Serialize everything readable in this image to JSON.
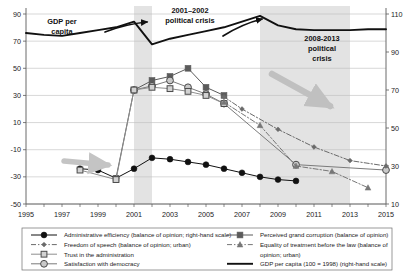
{
  "chart_data": {
    "type": "line",
    "title": "",
    "xlabel": "",
    "ylabel": "",
    "x": [
      1995,
      1996,
      1997,
      1998,
      1999,
      2000,
      2001,
      2002,
      2003,
      2004,
      2005,
      2006,
      2007,
      2008,
      2009,
      2010,
      2011,
      2012,
      2013,
      2014,
      2015
    ],
    "xlim": [
      1995,
      2015
    ],
    "xticks": [
      "1995",
      "1997",
      "1999",
      "2001",
      "2003",
      "2005",
      "2007",
      "2009",
      "2011",
      "2013",
      "2015"
    ],
    "left_axis": {
      "label": "balance of opinion",
      "ylim": [
        -50,
        90
      ],
      "yticks": [
        "90",
        "70",
        "50",
        "30",
        "10",
        "-10",
        "-30",
        "-50"
      ]
    },
    "right_axis": {
      "label": "GDP per capita (100 = 1998)",
      "ylim": [
        10,
        110
      ],
      "yticks": [
        "110",
        "90",
        "70",
        "50",
        "30",
        "10"
      ]
    },
    "grid": true,
    "legend_position": "bottom",
    "series": [
      {
        "name": "Administrative efficiency (balance of opinion; right-hand scale)",
        "key": "administrative-efficiency",
        "axis": "left",
        "marker": "filled-circle",
        "line": "solid",
        "color": "#111111",
        "points": [
          {
            "x": 1998,
            "y": -24
          },
          {
            "x": 1999,
            "y": -25
          },
          {
            "x": 2000,
            "y": -31
          },
          {
            "x": 2001,
            "y": -24
          },
          {
            "x": 2002,
            "y": -16
          },
          {
            "x": 2003,
            "y": -17
          },
          {
            "x": 2004,
            "y": -19
          },
          {
            "x": 2005,
            "y": -21
          },
          {
            "x": 2006,
            "y": -24
          },
          {
            "x": 2007,
            "y": -27
          },
          {
            "x": 2008,
            "y": -30
          },
          {
            "x": 2009,
            "y": -32
          },
          {
            "x": 2010,
            "y": -33
          }
        ]
      },
      {
        "name": "Perceived grand corruption (balance of opinion)",
        "key": "perceived-grand-corruption",
        "axis": "left",
        "marker": "filled-square",
        "line": "solid",
        "color": "#5b5b5b",
        "points": [
          {
            "x": 2000,
            "y": -31
          },
          {
            "x": 2001,
            "y": 34
          },
          {
            "x": 2002,
            "y": 41
          },
          {
            "x": 2003,
            "y": 44
          },
          {
            "x": 2004,
            "y": 50
          },
          {
            "x": 2005,
            "y": 36
          },
          {
            "x": 2006,
            "y": 30
          }
        ]
      },
      {
        "name": "Satisfaction with democracy",
        "key": "satisfaction-with-democracy",
        "axis": "left",
        "marker": "open-circle",
        "line": "solid",
        "color": "#7b7b7b",
        "points": [
          {
            "x": 2001,
            "y": 34
          },
          {
            "x": 2002,
            "y": 37
          },
          {
            "x": 2003,
            "y": 41
          },
          {
            "x": 2004,
            "y": 36
          },
          {
            "x": 2005,
            "y": 31
          },
          {
            "x": 2006,
            "y": 24
          },
          {
            "x": 2010,
            "y": -21
          },
          {
            "x": 2015,
            "y": -25
          }
        ]
      },
      {
        "name": "Trust in the administration",
        "key": "trust-in-the-administration",
        "axis": "left",
        "marker": "open-square",
        "line": "solid",
        "color": "#8e8e8e",
        "points": [
          {
            "x": 1998,
            "y": -25
          },
          {
            "x": 2000,
            "y": -32
          },
          {
            "x": 2001,
            "y": 34
          },
          {
            "x": 2002,
            "y": 36
          },
          {
            "x": 2003,
            "y": 35
          },
          {
            "x": 2004,
            "y": 33
          },
          {
            "x": 2005,
            "y": 30
          },
          {
            "x": 2006,
            "y": 24
          }
        ]
      },
      {
        "name": "Freedom of speech (balance of opinion; urban)",
        "key": "freedom-of-speech",
        "axis": "left",
        "marker": "small-diamond",
        "line": "dash-dot",
        "color": "#6a6a6a",
        "points": [
          {
            "x": 2006,
            "y": 29
          },
          {
            "x": 2007,
            "y": 20
          },
          {
            "x": 2009,
            "y": 5
          },
          {
            "x": 2011,
            "y": -8
          },
          {
            "x": 2013,
            "y": -18
          },
          {
            "x": 2015,
            "y": -22
          }
        ]
      },
      {
        "name": "Equality of treatment before the law (balance of opinion; urban)",
        "key": "equality-of-treatment",
        "axis": "left",
        "marker": "triangle",
        "line": "dash-dot",
        "color": "#777777",
        "points": [
          {
            "x": 2006,
            "y": 25
          },
          {
            "x": 2008,
            "y": 8
          },
          {
            "x": 2010,
            "y": -22
          },
          {
            "x": 2012,
            "y": -26
          },
          {
            "x": 2014,
            "y": -38
          }
        ]
      },
      {
        "name": "GDP per capita (100 = 1998) (right-hand scale)",
        "key": "gdp-per-capita",
        "axis": "right",
        "marker": "none",
        "line": "thick-solid",
        "color": "#111111",
        "points": [
          {
            "x": 1995,
            "y": 100
          },
          {
            "x": 1996,
            "y": 99
          },
          {
            "x": 1997,
            "y": 98.5
          },
          {
            "x": 1998,
            "y": 100
          },
          {
            "x": 1999,
            "y": 101.5
          },
          {
            "x": 2000,
            "y": 103
          },
          {
            "x": 2001,
            "y": 106
          },
          {
            "x": 2002,
            "y": 94
          },
          {
            "x": 2003,
            "y": 97
          },
          {
            "x": 2004,
            "y": 99
          },
          {
            "x": 2005,
            "y": 101
          },
          {
            "x": 2006,
            "y": 103
          },
          {
            "x": 2007,
            "y": 106
          },
          {
            "x": 2008,
            "y": 109
          },
          {
            "x": 2009,
            "y": 104
          },
          {
            "x": 2010,
            "y": 102
          },
          {
            "x": 2011,
            "y": 101.5
          },
          {
            "x": 2012,
            "y": 101.5
          },
          {
            "x": 2013,
            "y": 101.5
          },
          {
            "x": 2014,
            "y": 102
          },
          {
            "x": 2015,
            "y": 102
          }
        ]
      }
    ],
    "annotations": [
      {
        "key": "gdp-per-capita-label",
        "text": "GDP per\ncapita",
        "line1": "GDP per",
        "line2": "capita"
      },
      {
        "key": "crisis-2001",
        "line1": "2001–2002",
        "line2": "political crisis"
      },
      {
        "key": "crisis-2008",
        "line1": "2008-2013",
        "line2": "political",
        "line3": "crisis"
      }
    ],
    "shaded_bands": [
      {
        "key": "band-2001-2002",
        "from": 2001,
        "to": 2002,
        "label": "2001–2002 political crisis"
      },
      {
        "key": "band-2008-2013",
        "from": 2008,
        "to": 2013,
        "label": "2008-2013 political crisis"
      }
    ],
    "arrows": [
      {
        "key": "arrow-gdp-up",
        "direction": "up-right",
        "color": "#111111"
      },
      {
        "key": "arrow-gdp-up-2",
        "direction": "up-right",
        "color": "#111111"
      },
      {
        "key": "arrow-opinion-down",
        "direction": "down-right",
        "color": "#bdbdbd"
      },
      {
        "key": "arrow-admin-right",
        "direction": "right",
        "color": "#bdbdbd"
      }
    ]
  },
  "legend": {
    "left_column": [
      {
        "key": "administrative-efficiency",
        "label": "Administrative efficiency (balance of opinion; right-hand scale)"
      },
      {
        "key": "freedom-of-speech",
        "label": "Freedom of speech (balance of opinion; urban)"
      },
      {
        "key": "trust-in-the-administration",
        "label": "Trust in the administration"
      },
      {
        "key": "satisfaction-with-democracy",
        "label": "Satisfaction with democracy"
      }
    ],
    "right_column": [
      {
        "key": "perceived-grand-corruption",
        "label": "Perceived grand corruption (balance of opinion)"
      },
      {
        "key": "equality-of-treatment",
        "label": "Equality of treatment before the law (balance of"
      },
      {
        "key": "equality-of-treatment-2",
        "label": "opinion; urban)"
      },
      {
        "key": "gdp-per-capita",
        "label": "GDP per capita (100 = 1998) (right-hand scale)"
      }
    ]
  },
  "axis": {
    "x_ticks": [
      "1995",
      "1997",
      "1999",
      "2001",
      "2003",
      "2005",
      "2007",
      "2009",
      "2011",
      "2013",
      "2015"
    ],
    "y_left_ticks": [
      "90",
      "70",
      "50",
      "30",
      "10",
      "-10",
      "-30",
      "-50"
    ],
    "y_right_ticks": [
      "110",
      "90",
      "70",
      "50",
      "30",
      "10"
    ]
  }
}
